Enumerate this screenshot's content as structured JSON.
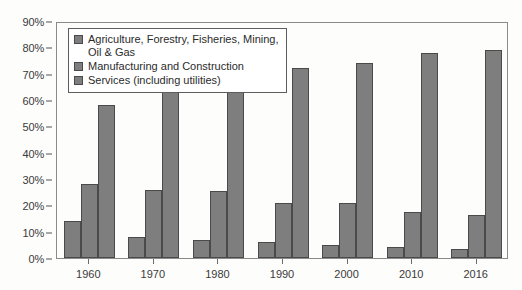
{
  "chart_data": {
    "type": "bar",
    "title": "",
    "subtitle": "",
    "xlabel": "",
    "ylabel": "",
    "categories": [
      "1960",
      "1970",
      "1980",
      "1990",
      "2000",
      "2010",
      "2016"
    ],
    "series": [
      {
        "name": "Agriculture, Forestry, Fisheries, Mining,\nOil & Gas",
        "values": [
          14,
          8,
          7,
          6,
          5,
          4,
          3.5
        ]
      },
      {
        "name": "Manufacturing and Construction",
        "values": [
          28,
          26,
          25.5,
          21,
          21,
          17.5,
          16.5
        ]
      },
      {
        "name": "Services (including utilities)",
        "values": [
          58,
          66,
          67,
          72,
          74,
          78,
          79
        ]
      }
    ],
    "ylim": [
      0,
      90
    ],
    "ytick_values": [
      0,
      10,
      20,
      30,
      40,
      50,
      60,
      70,
      80,
      90
    ],
    "ytick_labels": [
      "0%",
      "10%",
      "20%",
      "30%",
      "40%",
      "50%",
      "60%",
      "70%",
      "80%",
      "90%"
    ],
    "grid": false,
    "legend_position": "upper-left-inside",
    "colors": {
      "bar_fill": "#7e7e7e",
      "bar_border": "#4a4a4a",
      "axis": "#8a8a8a",
      "text": "#2b2b2b",
      "background": "#fdfdfc"
    }
  }
}
